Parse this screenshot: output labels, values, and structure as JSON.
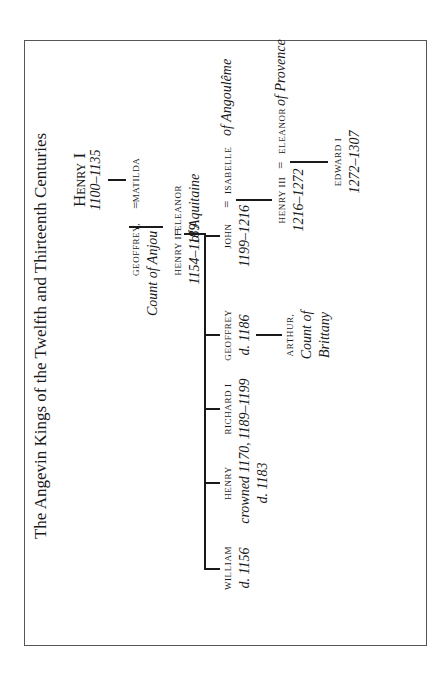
{
  "title": "The Angevin Kings of the Twelfth and Thirteenth Centuries",
  "people": {
    "henry_i": {
      "name": "Henry I",
      "dates": "1100–1135"
    },
    "matilda": {
      "name": "Matilda"
    },
    "geoffrey_anjou": {
      "name": "Geoffrey,",
      "title": "Count of Anjou"
    },
    "eleanor_aquitaine": {
      "name": "Eleanor",
      "title": "of Aquitaine"
    },
    "henry_ii": {
      "name": "Henry II",
      "dates": "1154–1189"
    },
    "william": {
      "name": "William",
      "dates": "d. 1156"
    },
    "henry_young": {
      "name": "Henry",
      "dates_1": "crowned 1170,",
      "dates_2": "d. 1183"
    },
    "richard_i": {
      "name": "Richard I",
      "dates": "1189–1199"
    },
    "geoffrey": {
      "name": "Geoffrey",
      "dates": "d. 1186"
    },
    "arthur": {
      "name": "Arthur,",
      "title_1": "Count of",
      "title_2": "Brittany"
    },
    "john": {
      "name": "John",
      "dates": "1199–1216"
    },
    "isabelle": {
      "name": "Isabelle",
      "title": "of Angoulême"
    },
    "henry_iii": {
      "name": "Henry III",
      "dates": "1216–1272"
    },
    "eleanor_provence": {
      "name": "Eleanor",
      "title": "of Provence"
    },
    "edward_i": {
      "name": "Edward I",
      "dates": "1272–1307"
    }
  },
  "marriage_symbol": "="
}
